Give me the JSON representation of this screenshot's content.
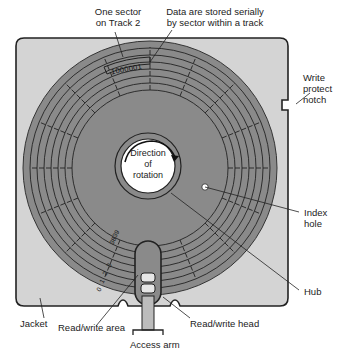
{
  "diagram": {
    "colors": {
      "jacket": "#d4d4d4",
      "jacket_border": "#222222",
      "disk": "#8a8a8a",
      "track_lines": "#222222",
      "hub_center": "#ffffff",
      "label_text": "#222222"
    },
    "labels": {
      "one_sector": "One sector\non Track 2",
      "data_stored": "Data are stored serially\nby sector within a track",
      "write_protect": "Write\nprotect\nnotch",
      "rotation": "Direction\nof\nrotation",
      "index_hole": "Index\nhole",
      "hub": "Hub",
      "jacket": "Jacket",
      "rw_area": "Read/write area",
      "rw_head": "Read/write head",
      "access_arm": "Access arm"
    },
    "sector_bits": "1000001",
    "track_numbers": [
      "39",
      "38",
      "3",
      "2",
      "1",
      "0"
    ],
    "track_count": 40,
    "sector_count": 8
  }
}
